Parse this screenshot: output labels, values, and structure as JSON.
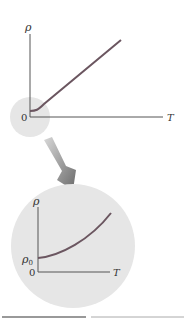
{
  "top_graph": {
    "y_label": "ρ",
    "x_label": "T",
    "origin_label": "0"
  },
  "bottom_graph": {
    "y_label": "ρ",
    "x_label": "T",
    "origin_label": "0",
    "intercept_label": "ρ",
    "intercept_subscript": "0"
  },
  "colors": {
    "curve": "#6b5660",
    "axis": "#555555",
    "highlight": "#e6e6e6",
    "arrow": "#777777",
    "rule": "#888888"
  }
}
